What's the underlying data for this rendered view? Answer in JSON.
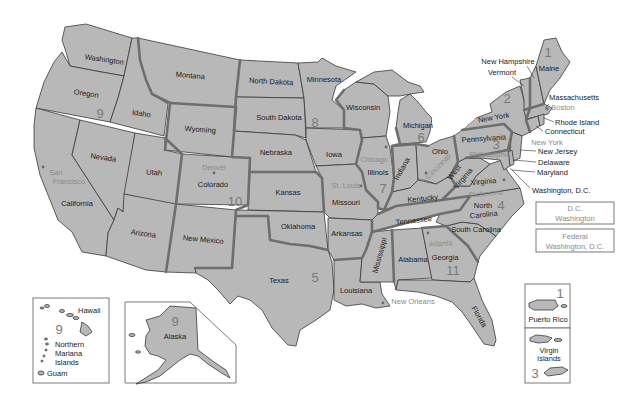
{
  "map": {
    "fill_color": "#b8b8b8",
    "border_color": "#3a3a3a",
    "circuit_border_color": "#6e6e6e",
    "city_label_color": "#8a8a8a",
    "number_color": "#7a7a7a"
  },
  "states": {
    "washington": "Washington",
    "oregon": "Oregon",
    "california": "California",
    "nevada": "Nevada",
    "idaho": "Idaho",
    "montana": "Montana",
    "wyoming": "Wyoming",
    "utah": "Utah",
    "colorado": "Colorado",
    "arizona": "Arizona",
    "new_mexico": "New Mexico",
    "north_dakota": "North Dakota",
    "south_dakota": "South Dakota",
    "nebraska": "Nebraska",
    "kansas": "Kansas",
    "oklahoma": "Oklahoma",
    "texas": "Texas",
    "minnesota": "Minnesota",
    "iowa": "Iowa",
    "missouri": "Missouri",
    "arkansas": "Arkansas",
    "louisiana": "Louisiana",
    "wisconsin": "Wisconsin",
    "illinois": "Illinois",
    "michigan": "Michigan",
    "indiana": "Indiana",
    "ohio": "Ohio",
    "kentucky": "Kentucky",
    "tennessee": "Tennessee",
    "mississippi": "Mississippi",
    "alabama": "Alabama",
    "georgia": "Georgia",
    "florida": "Florida",
    "south_carolina": "South Carolina",
    "north_carolina_1": "North",
    "north_carolina_2": "Carolina",
    "virginia": "Virginia",
    "west_virginia_1": "West",
    "west_virginia_2": "Virginia",
    "pennsylvania": "Pennsylvania",
    "new_york": "New York",
    "maine": "Maine",
    "alaska": "Alaska",
    "hawaii": "Hawaii",
    "guam": "Guam",
    "northern_mariana_1": "Northern",
    "northern_mariana_2": "Mariana",
    "northern_mariana_3": "Islands",
    "puerto_rico": "Puerto Rico",
    "virgin_islands_1": "Virgin",
    "virgin_islands_2": "Islands"
  },
  "callouts": {
    "new_hampshire": "New Hampshire",
    "vermont": "Vermont",
    "massachusetts": "Massachusetts",
    "rhode_island": "Rhode Island",
    "connecticut": "Connecticut",
    "new_jersey": "New Jersey",
    "delaware": "Delaware",
    "maryland": "Maryland",
    "washington_dc": "Washington, D.C."
  },
  "cities": {
    "san_francisco_1": "San",
    "san_francisco_2": "Francisco",
    "denver": "Denver",
    "st_louis": "St. Louis",
    "chicago": "Chicago",
    "cincinnati": "Cincinnati",
    "philadelphia": "Philadelphia",
    "new_york": "New York",
    "boston": "Boston",
    "richmond": "Richmond",
    "atlanta": "Atlanta",
    "new_orleans": "New Orleans"
  },
  "circuits": {
    "c1": "1",
    "c2": "2",
    "c3": "3",
    "c4": "4",
    "c5": "5",
    "c6": "6",
    "c7": "7",
    "c8": "8",
    "c9": "9",
    "c10": "10",
    "c11": "11",
    "c9_hawaii": "9",
    "c9_alaska": "9",
    "c1_pr": "1",
    "c3_vi": "3"
  },
  "dc_boxes": {
    "dc_line1": "D.C.",
    "dc_line2": "Washington",
    "federal_line1": "Federal",
    "federal_line2": "Washington, D.C."
  }
}
